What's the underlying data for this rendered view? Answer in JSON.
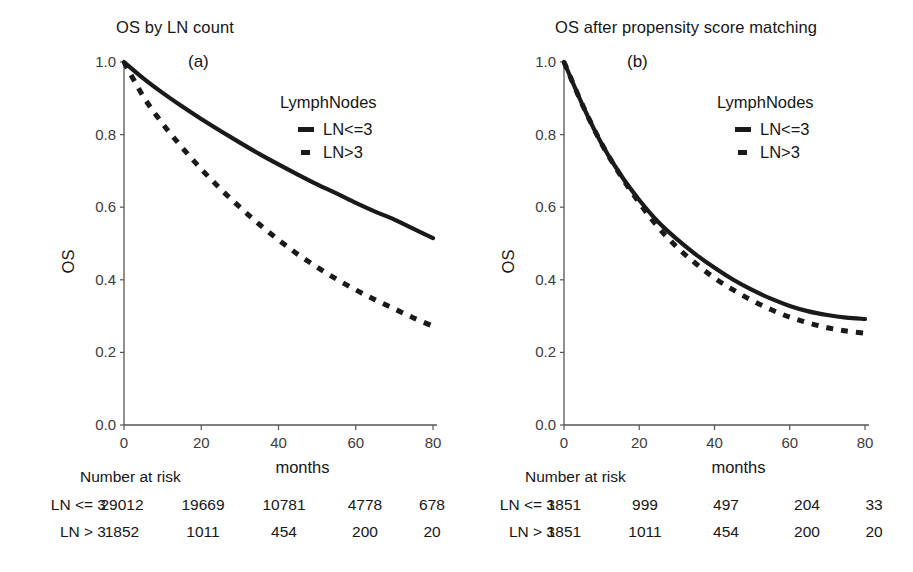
{
  "figure": {
    "width": 913,
    "height": 572,
    "background": "#ffffff",
    "line_color": "#1a1a1a"
  },
  "panels": [
    {
      "id": "a",
      "title": "OS by LN count",
      "tag": "(a)",
      "legend": {
        "title": "LymphNodes",
        "items": [
          {
            "label": "LN<=3",
            "style": "solid"
          },
          {
            "label": "LN>3",
            "style": "dashed"
          }
        ]
      },
      "risk_table": {
        "heading": "Number at risk",
        "rows": [
          {
            "label": "LN <= 3",
            "values": [
              "29012",
              "19669",
              "10781",
              "4778",
              "678"
            ]
          },
          {
            "label": "LN > 3",
            "values": [
              "1852",
              "1011",
              "454",
              "200",
              "20"
            ]
          }
        ]
      }
    },
    {
      "id": "b",
      "title": "OS after propensity score matching",
      "tag": "(b)",
      "legend": {
        "title": "LymphNodes",
        "items": [
          {
            "label": "LN<=3",
            "style": "solid"
          },
          {
            "label": "LN>3",
            "style": "dashed"
          }
        ]
      },
      "risk_table": {
        "heading": "Number at risk",
        "rows": [
          {
            "label": "LN <= 3",
            "values": [
              "1851",
              "999",
              "497",
              "204",
              "33"
            ]
          },
          {
            "label": "LN > 3",
            "values": [
              "1851",
              "1011",
              "454",
              "200",
              "20"
            ]
          }
        ]
      }
    }
  ],
  "chart_data": [
    {
      "type": "line",
      "panel": "a",
      "title": "OS by LN count",
      "annotation": "(a)",
      "xlabel": "months",
      "ylabel": "OS",
      "xlim": [
        0,
        80
      ],
      "ylim": [
        0.0,
        1.0
      ],
      "xticks": [
        0,
        20,
        40,
        60,
        80
      ],
      "xticklabels": [
        "0",
        "20",
        "40",
        "60",
        "80"
      ],
      "yticks": [
        0.0,
        0.2,
        0.4,
        0.6,
        0.8,
        1.0
      ],
      "yticklabels": [
        "0.0",
        "0.2",
        "0.4",
        "0.6",
        "0.8",
        "1.0"
      ],
      "grid": false,
      "legend_title": "LymphNodes",
      "legend_position": "upper right inside",
      "x": [
        0,
        5,
        10,
        15,
        20,
        25,
        30,
        35,
        40,
        45,
        50,
        55,
        60,
        65,
        70,
        75,
        80
      ],
      "series": [
        {
          "name": "LN<=3",
          "style": "solid",
          "values": [
            1.0,
            0.955,
            0.915,
            0.878,
            0.843,
            0.81,
            0.778,
            0.747,
            0.718,
            0.69,
            0.663,
            0.638,
            0.612,
            0.588,
            0.566,
            0.54,
            0.515
          ]
        },
        {
          "name": "LN>3",
          "style": "dashed",
          "values": [
            1.0,
            0.905,
            0.83,
            0.765,
            0.705,
            0.65,
            0.6,
            0.553,
            0.51,
            0.47,
            0.435,
            0.402,
            0.372,
            0.345,
            0.32,
            0.295,
            0.272
          ]
        }
      ]
    },
    {
      "type": "line",
      "panel": "b",
      "title": "OS after propensity score matching",
      "annotation": "(b)",
      "xlabel": "months",
      "ylabel": "OS",
      "xlim": [
        0,
        80
      ],
      "ylim": [
        0.0,
        1.0
      ],
      "xticks": [
        0,
        20,
        40,
        60,
        80
      ],
      "xticklabels": [
        "0",
        "20",
        "40",
        "60",
        "80"
      ],
      "yticks": [
        0.0,
        0.2,
        0.4,
        0.6,
        0.8,
        1.0
      ],
      "yticklabels": [
        "0.0",
        "0.2",
        "0.4",
        "0.6",
        "0.8",
        "1.0"
      ],
      "grid": false,
      "legend_title": "LymphNodes",
      "legend_position": "upper right inside",
      "x": [
        0,
        5,
        10,
        15,
        20,
        25,
        30,
        35,
        40,
        45,
        50,
        55,
        60,
        65,
        70,
        75,
        80
      ],
      "series": [
        {
          "name": "LN<=3",
          "style": "solid",
          "values": [
            1.0,
            0.88,
            0.775,
            0.69,
            0.62,
            0.56,
            0.512,
            0.47,
            0.433,
            0.4,
            0.372,
            0.348,
            0.328,
            0.313,
            0.303,
            0.296,
            0.292
          ]
        },
        {
          "name": "LN>3",
          "style": "dashed",
          "values": [
            1.0,
            0.88,
            0.775,
            0.688,
            0.612,
            0.545,
            0.49,
            0.445,
            0.405,
            0.372,
            0.343,
            0.318,
            0.297,
            0.281,
            0.268,
            0.259,
            0.253
          ]
        }
      ]
    }
  ],
  "axes_geometry": {
    "panel_a": {
      "x0": 124,
      "x1": 433,
      "y_top": 62,
      "y_bottom": 425
    },
    "panel_b": {
      "x0": 109,
      "x1": 410,
      "y_top": 62,
      "y_bottom": 425
    }
  },
  "risk_columns_x": [
    122,
    203,
    284,
    365,
    432
  ]
}
